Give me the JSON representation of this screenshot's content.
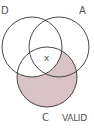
{
  "diagram": {
    "type": "venn",
    "sets": [
      {
        "id": "D",
        "label": "D",
        "cx": 32,
        "cy": 47,
        "r": 30
      },
      {
        "id": "A",
        "label": "A",
        "cx": 59,
        "cy": 47,
        "r": 30
      },
      {
        "id": "C",
        "label": "C",
        "cx": 47,
        "cy": 77,
        "r": 30
      }
    ],
    "shaded_region": "C minus D",
    "center_mark": "x",
    "verdict": "VALID",
    "colors": {
      "stroke": "#333333",
      "shade": "#d9c3c6",
      "background": "#ffffff"
    }
  }
}
